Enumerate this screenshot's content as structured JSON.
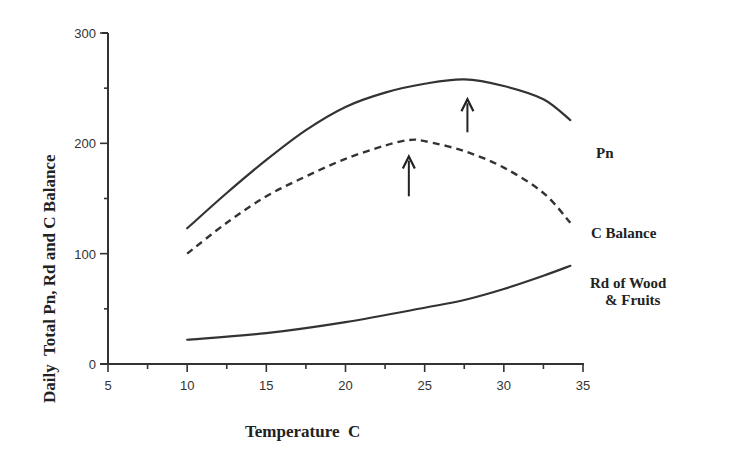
{
  "chart_data": {
    "type": "line",
    "title": "",
    "xlabel": "Temperature  C",
    "ylabel": "Daily  Total Pn, Rd and C Balance",
    "xlim": [
      5,
      35
    ],
    "ylim": [
      0,
      300
    ],
    "x_ticks": [
      5,
      10,
      15,
      20,
      25,
      30,
      35
    ],
    "y_ticks": [
      0,
      100,
      200,
      300
    ],
    "grid": false,
    "legend_position": "inline labels right of curves",
    "series": [
      {
        "name": "Pn",
        "style": "solid",
        "x": [
          10,
          12.5,
          15,
          17.5,
          20,
          22.5,
          25,
          27.5,
          30,
          32.5,
          34.2
        ],
        "values": [
          123,
          155,
          185,
          212,
          233,
          246,
          254,
          258,
          252,
          240,
          221
        ]
      },
      {
        "name": "C Balance",
        "style": "dashed",
        "x": [
          10,
          12.5,
          15,
          17.5,
          20,
          22.5,
          24,
          25,
          27.5,
          30,
          32.5,
          34.2
        ],
        "values": [
          100,
          128,
          152,
          170,
          186,
          198,
          203,
          202,
          193,
          178,
          155,
          128
        ]
      },
      {
        "name": "Rd of Wood & Fruits",
        "style": "solid",
        "x": [
          10,
          15,
          20,
          25,
          27.5,
          30,
          32.5,
          34.2
        ],
        "values": [
          22,
          28,
          38,
          51,
          58,
          68,
          80,
          89
        ]
      }
    ],
    "annotations": [
      {
        "type": "arrow-up",
        "x": 27.7,
        "y_from": 210,
        "y_to": 240,
        "note": "Pn optimum"
      },
      {
        "type": "arrow-up",
        "x": 24.0,
        "y_from": 152,
        "y_to": 188,
        "note": "C Balance optimum"
      }
    ]
  },
  "labels": {
    "xlabel": "Temperature  C",
    "ylabel": "Daily  Total Pn, Rd and C Balance",
    "pn": "Pn",
    "cbal": "C  Balance",
    "rd_line1": "Rd  of  Wood",
    "rd_line2": "& Fruits"
  },
  "ticks": {
    "x": [
      "5",
      "10",
      "15",
      "20",
      "25",
      "30",
      "35"
    ],
    "y": [
      "0",
      "100",
      "200",
      "300"
    ]
  }
}
